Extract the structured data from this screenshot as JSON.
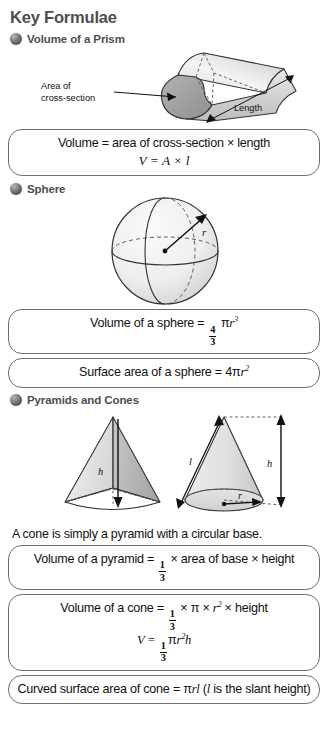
{
  "document": {
    "title": "Key Formulae",
    "accent_color": "#4d4d4d",
    "box_border_color": "#6f7072",
    "background_color": "#ffffff"
  },
  "sections": [
    {
      "id": "prism",
      "heading": "Volume of a Prism",
      "bullet_icon": "sphere-bullet-icon",
      "figure": {
        "name": "prism-diagram",
        "labels": {
          "area_line1": "Area of",
          "area_line2": "cross-section",
          "length": "Length"
        }
      },
      "formulas": [
        {
          "name": "prism-volume-formula",
          "lines": [
            {
              "style": "plain",
              "text": "Volume = area of cross-section × length"
            },
            {
              "style": "italic",
              "text": "V = A × l"
            }
          ]
        }
      ]
    },
    {
      "id": "sphere",
      "heading": "Sphere",
      "bullet_icon": "sphere-bullet-icon",
      "figure": {
        "name": "sphere-diagram",
        "labels": {
          "radius": "r"
        }
      },
      "formulas": [
        {
          "name": "sphere-volume-formula",
          "lines": [
            {
              "style": "fraction",
              "prefix": "Volume of a sphere = ",
              "numerator": "4",
              "denominator": "3",
              "suffix_pi": "π",
              "suffix_var": "r",
              "suffix_exp": "3"
            }
          ]
        },
        {
          "name": "sphere-surface-area-formula",
          "lines": [
            {
              "style": "plain-math",
              "prefix": "Surface area of a sphere = 4",
              "pi": "π",
              "var": "r",
              "exp": "2"
            }
          ]
        }
      ]
    },
    {
      "id": "pyramids-cones",
      "heading": "Pyramids and Cones",
      "bullet_icon": "sphere-bullet-icon",
      "figure": {
        "name": "pyramid-and-cone-diagram",
        "labels": {
          "pyramid_height": "h",
          "cone_slant": "l",
          "cone_height": "h",
          "cone_radius": "r"
        }
      },
      "note": "A cone is simply a pyramid with a circular base.",
      "formulas": [
        {
          "name": "pyramid-volume-formula",
          "prefix": "Volume of a pyramid = ",
          "numerator": "1",
          "denominator": "3",
          "suffix": " × area of base × height"
        },
        {
          "name": "cone-volume-formula",
          "line1_prefix": "Volume of a cone = ",
          "line1_numerator": "1",
          "line1_denominator": "3",
          "line1_mid": " × π × ",
          "line1_var": "r",
          "line1_exp": "2",
          "line1_suffix": " × height",
          "line2_prefix": "V = ",
          "line2_numerator": "1",
          "line2_denominator": "3",
          "line2_pi": "π",
          "line2_var1": "r",
          "line2_exp": "2",
          "line2_var2": "h"
        },
        {
          "name": "cone-curved-surface-area-formula",
          "prefix": "Curved surface area of cone = ",
          "pi": "π",
          "var1": "r",
          "var2": "l",
          "note_open": " (",
          "note_var": "l",
          "note_text": " is the slant height)"
        }
      ]
    }
  ]
}
